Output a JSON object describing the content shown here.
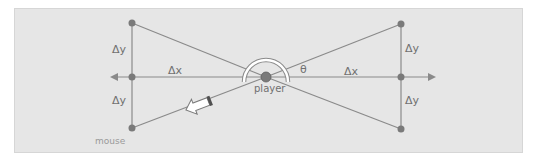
{
  "diagram": {
    "labels": {
      "delta_y": "Δy",
      "delta_x": "Δx",
      "theta": "θ",
      "player": "player",
      "mouse": "mouse"
    },
    "colors": {
      "background": "#e6e6e6",
      "line": "#8a8a8a",
      "dot": "#7a7a7a",
      "text": "#707070",
      "mouse_text": "#9a9a9a",
      "arc": "#ffffff"
    }
  }
}
